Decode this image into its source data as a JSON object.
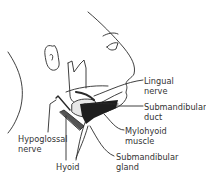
{
  "diagram": {
    "labels": {
      "lingual_nerve": {
        "line1": "Lingual",
        "line2": "nerve"
      },
      "submandibular_duct": {
        "line1": "Submandibular",
        "line2": "duct"
      },
      "mylohyoid_muscle": {
        "line1": "Mylohyoid",
        "line2": "muscle"
      },
      "submandibular_gland": {
        "line1": "Submandibular",
        "line2": "gland"
      },
      "hypoglossal_nerve": {
        "line1": "Hypoglossal",
        "line2": "nerve"
      },
      "hyoid": {
        "line1": "Hyoid"
      }
    },
    "colors": {
      "line": "#2a2a2a",
      "text": "#333333",
      "background": "#ffffff",
      "muscle_fill": "#1e1e1e",
      "gland_fill": "#e8e8e8"
    }
  }
}
